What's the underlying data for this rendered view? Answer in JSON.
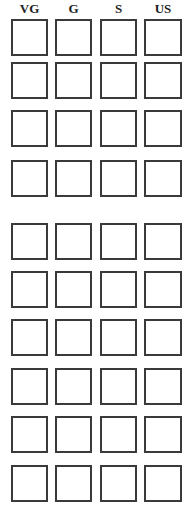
{
  "form": {
    "columns": [
      {
        "label": "VG",
        "x": 11
      },
      {
        "label": "G",
        "x": 55
      },
      {
        "label": "S",
        "x": 100
      },
      {
        "label": "US",
        "x": 144
      }
    ],
    "row_tops": [
      19,
      62,
      110,
      160,
      223,
      271,
      319,
      368,
      416,
      465
    ],
    "box_size": 37,
    "border_color": "#3a3a3a",
    "header_color": "#222222"
  }
}
